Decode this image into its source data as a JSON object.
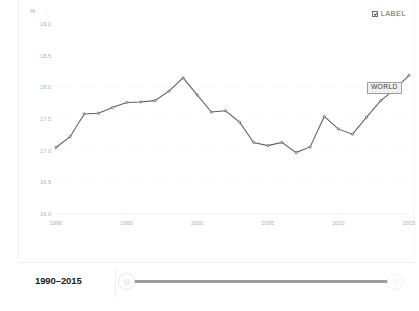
{
  "chart_data": {
    "type": "line",
    "title": "",
    "subtitle": "",
    "xlabel": "",
    "ylabel": "%",
    "unit": "%",
    "grid": true,
    "legend_position": "top-right",
    "xlim": [
      1990,
      2015
    ],
    "ylim": [
      16.0,
      19.0
    ],
    "ytick_labels": [
      "19.0",
      "18.5",
      "18.0",
      "17.5",
      "17.0",
      "16.5",
      "16.0"
    ],
    "ytick_values": [
      19.0,
      18.5,
      18.0,
      17.5,
      17.0,
      16.5,
      16.0
    ],
    "xtick_labels": [
      "1990",
      "1995",
      "2000",
      "2005",
      "2010",
      "2015"
    ],
    "xtick_values": [
      1990,
      1995,
      2000,
      2005,
      2010,
      2015
    ],
    "x": [
      1990,
      1991,
      1992,
      1993,
      1994,
      1995,
      1996,
      1997,
      1998,
      1999,
      2000,
      2001,
      2002,
      2003,
      2004,
      2005,
      2006,
      2007,
      2008,
      2009,
      2010,
      2011,
      2012,
      2013,
      2014,
      2015
    ],
    "series": [
      {
        "name": "WORLD",
        "color": "#5d5d6b",
        "values": [
          17.05,
          17.22,
          17.58,
          17.59,
          17.68,
          17.76,
          17.77,
          17.79,
          17.94,
          18.15,
          17.88,
          17.61,
          17.63,
          17.45,
          17.13,
          17.08,
          17.13,
          16.97,
          17.06,
          17.54,
          17.34,
          17.26,
          17.53,
          17.79,
          17.97,
          18.19
        ]
      }
    ],
    "annotations": [
      {
        "text": "WORLD",
        "series": "WORLD",
        "near_x": 2014,
        "near_y": 18.0
      }
    ]
  },
  "legend": {
    "label_toggle_text": "LABEL",
    "label_toggle_checked": true
  },
  "timebar": {
    "range_readout": "1990–2015",
    "slider_min": 1990,
    "slider_max": 2015,
    "slider_value_start": 1990,
    "slider_value_end": 2015
  }
}
